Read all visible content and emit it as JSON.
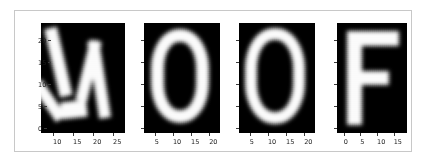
{
  "figure": {
    "background": "#ffffff",
    "frame_color": "#c8c8c8",
    "colormap": "gray",
    "word": "WOOF"
  },
  "chart_data": {
    "type": "heatmap",
    "title": "",
    "xlabel": "",
    "ylabel": "",
    "grid": false,
    "legend_position": "none",
    "panels": [
      {
        "name": "panel-w",
        "letter": "W",
        "xticks": [
          "10",
          "15",
          "20",
          "25"
        ],
        "xtick_values": [
          10,
          15,
          20,
          25
        ],
        "yticks": [
          "0",
          "5",
          "10",
          "15",
          "20"
        ],
        "ytick_values": [
          0,
          5,
          10,
          15,
          20
        ],
        "xlim": [
          7,
          28
        ],
        "ylim": [
          24,
          -1
        ],
        "show_ylabels": true
      },
      {
        "name": "panel-o-1",
        "letter": "O",
        "xticks": [
          "5",
          "10",
          "15",
          "20"
        ],
        "xtick_values": [
          5,
          10,
          15,
          20
        ],
        "yticks": [
          "0",
          "5",
          "10",
          "15",
          "20"
        ],
        "ytick_values": [
          0,
          5,
          10,
          15,
          20
        ],
        "xlim": [
          2,
          23
        ],
        "ylim": [
          24,
          -1
        ],
        "show_ylabels": false
      },
      {
        "name": "panel-o-2",
        "letter": "O",
        "xticks": [
          "5",
          "10",
          "15",
          "20"
        ],
        "xtick_values": [
          5,
          10,
          15,
          20
        ],
        "yticks": [
          "0",
          "5",
          "10",
          "15",
          "20"
        ],
        "ytick_values": [
          0,
          5,
          10,
          15,
          20
        ],
        "xlim": [
          2,
          23
        ],
        "ylim": [
          24,
          -1
        ],
        "show_ylabels": false
      },
      {
        "name": "panel-f",
        "letter": "F",
        "xticks": [
          "0",
          "5",
          "10",
          "15"
        ],
        "xtick_values": [
          0,
          5,
          10,
          15
        ],
        "yticks": [
          "0",
          "5",
          "10",
          "15",
          "20"
        ],
        "ytick_values": [
          0,
          5,
          10,
          15,
          20
        ],
        "xlim": [
          -2,
          19
        ],
        "ylim": [
          24,
          -1
        ],
        "show_ylabels": false
      }
    ]
  }
}
